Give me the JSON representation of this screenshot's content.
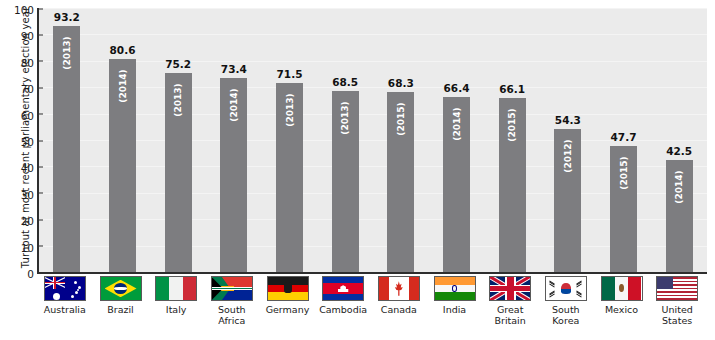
{
  "chart_data": {
    "type": "bar",
    "title": "",
    "xlabel": "",
    "ylabel": "Turnout at most recent parliamentary election year",
    "ylim": [
      0,
      100
    ],
    "ytick_labels": [
      "100",
      "90",
      "80",
      "70",
      "60",
      "50",
      "40",
      "30",
      "20",
      "10",
      "0"
    ],
    "ytick_values": [
      100,
      90,
      80,
      70,
      60,
      50,
      40,
      30,
      20,
      10,
      0
    ],
    "grid": true,
    "legend": "none",
    "bar_color": "#7d7d80",
    "plot_background": "#ebebeb",
    "axis_color": "#2e2e2e",
    "value_label_color": "#111111",
    "year_label_color": "#ffffff",
    "categories": [
      "Australia",
      "Brazil",
      "Italy",
      "South\nAfrica",
      "Germany",
      "Cambodia",
      "Canada",
      "India",
      "Great\nBritain",
      "South\nKorea",
      "Mexico",
      "United\nStates"
    ],
    "values": [
      93.2,
      80.6,
      75.2,
      73.4,
      71.5,
      68.5,
      68.3,
      66.4,
      66.1,
      54.3,
      47.7,
      42.5
    ],
    "value_labels": [
      "93.2",
      "80.6",
      "75.2",
      "73.4",
      "71.5",
      "68.5",
      "68.3",
      "66.4",
      "66.1",
      "54.3",
      "47.7",
      "42.5"
    ],
    "years": [
      2013,
      2014,
      2013,
      2014,
      2013,
      2013,
      2015,
      2014,
      2015,
      2012,
      2015,
      2014
    ],
    "year_labels": [
      "(2013)",
      "(2014)",
      "(2013)",
      "(2014)",
      "(2013)",
      "(2013)",
      "(2015)",
      "(2014)",
      "(2015)",
      "(2012)",
      "(2015)",
      "(2014)"
    ],
    "flag_icons": [
      "flag-australia-icon",
      "flag-brazil-icon",
      "flag-italy-icon",
      "flag-south-africa-icon",
      "flag-germany-icon",
      "flag-cambodia-icon",
      "flag-canada-icon",
      "flag-india-icon",
      "flag-great-britain-icon",
      "flag-south-korea-icon",
      "flag-mexico-icon",
      "flag-united-states-icon"
    ]
  }
}
